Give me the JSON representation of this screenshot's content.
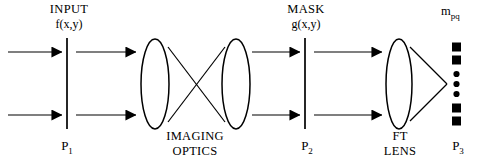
{
  "figure": {
    "title_region": "optical correlator schematic",
    "background_color": "#ffffff",
    "ink_color": "#000000",
    "width": 480,
    "height": 168
  },
  "labels": {
    "input_title": "INPUT",
    "input_function": "f(x,y)",
    "plane_1": "P",
    "plane_1_sub": "1",
    "imaging_line_1": "IMAGING",
    "imaging_line_2": "OPTICS",
    "mask_title": "MASK",
    "mask_function": "g(x,y)",
    "plane_2": "P",
    "plane_2_sub": "2",
    "ft_line_1": "FT",
    "ft_line_2": "LENS",
    "plane_3": "P",
    "plane_3_sub": "3",
    "output_symbol": "m",
    "output_symbol_sub": "pq"
  },
  "elements": {
    "input_plane": {
      "name": "P1 input plane",
      "x": 67,
      "y_top": 38,
      "y_bottom": 129
    },
    "imaging_lens_1": {
      "name": "imaging lens 1",
      "cx": 155,
      "cy": 84,
      "rx": 14,
      "ry": 45
    },
    "imaging_lens_2": {
      "name": "imaging lens 2",
      "cx": 236,
      "cy": 84,
      "rx": 14,
      "ry": 45
    },
    "mask_plane": {
      "name": "P2 mask plane",
      "x": 305,
      "y_top": 38,
      "y_bottom": 129
    },
    "ft_lens": {
      "name": "Fourier transform lens",
      "cx": 399,
      "cy": 84,
      "rx": 13,
      "ry": 45
    },
    "output_plane": {
      "name": "P3 output detector array",
      "x": 457,
      "cy": 84
    },
    "ray_crossover": {
      "x": 196,
      "y": 84
    },
    "ft_focus": {
      "x": 447,
      "y": 84
    }
  },
  "beams": {
    "upper_y": 52,
    "lower_y": 115,
    "segments": [
      {
        "name": "input-upper",
        "x1": 8,
        "x2": 64
      },
      {
        "name": "input-lower",
        "x1": 8,
        "x2": 64
      },
      {
        "name": "post-input-upper",
        "x1": 75,
        "x2": 138
      },
      {
        "name": "post-input-lower",
        "x1": 75,
        "x2": 138
      },
      {
        "name": "post-imaging-upper",
        "x1": 252,
        "x2": 302
      },
      {
        "name": "post-imaging-lower",
        "x1": 252,
        "x2": 302
      },
      {
        "name": "post-mask-upper",
        "x1": 313,
        "x2": 384
      },
      {
        "name": "post-mask-lower",
        "x1": 313,
        "x2": 384
      }
    ]
  },
  "detector_array": {
    "description": "vertical column of detector elements at output plane P3",
    "items": [
      {
        "shape": "square",
        "size": 9
      },
      {
        "shape": "square",
        "size": 9
      },
      {
        "shape": "dot",
        "size": 6
      },
      {
        "shape": "dot",
        "size": 6
      },
      {
        "shape": "dot",
        "size": 6
      },
      {
        "shape": "square",
        "size": 9
      },
      {
        "shape": "square",
        "size": 9
      }
    ],
    "y_positions": [
      47,
      60,
      74,
      84,
      94,
      108,
      121
    ]
  }
}
